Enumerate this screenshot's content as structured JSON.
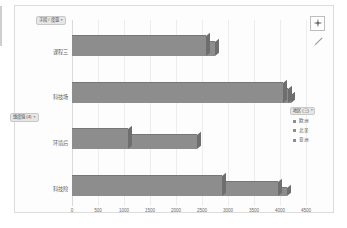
{
  "chart_data": {
    "type": "bar",
    "orientation": "horizontal",
    "stacked": true,
    "title": "",
    "subtitle": "",
    "xlabel": "",
    "ylabel": "",
    "xlim": [
      0,
      4500
    ],
    "xticks": [
      "0",
      "500",
      "1000",
      "1500",
      "2000",
      "2500",
      "3000",
      "3500",
      "4000",
      "4500"
    ],
    "grid": true,
    "legend_position": "right",
    "categories": [
      "课程三",
      "科技场",
      "环境后",
      "科技险"
    ],
    "series": [
      {
        "name": "欧洲",
        "values": [
          2580,
          4050,
          1080,
          2880
        ]
      },
      {
        "name": "北美",
        "values": [
          170,
          100,
          1320,
          1080
        ]
      },
      {
        "name": "亚洲",
        "values": [
          0,
          60,
          0,
          180
        ]
      }
    ],
    "totals": [
      2750,
      4210,
      2400,
      4140
    ],
    "bar_color": "#8d8d8d",
    "grid_color": "#ededed",
    "axis_color": "#dadada"
  },
  "toolbar": {
    "add_label": "+",
    "add_icon": "plus-icon",
    "edit_icon": "pencil-icon"
  },
  "filters": {
    "top_pill": {
      "label": "字段 / 度量",
      "caret": "▾"
    },
    "mid_pill": {
      "label": "维度值 (4)",
      "caret": "▾"
    }
  },
  "legend": {
    "title": {
      "label": "地区 (三)",
      "caret": "▾"
    },
    "items": [
      {
        "label": "欧洲",
        "color": "#8d8d8d"
      },
      {
        "label": "北美",
        "color": "#8d8d8d"
      },
      {
        "label": "亚洲",
        "color": "#8d8d8d"
      }
    ]
  }
}
